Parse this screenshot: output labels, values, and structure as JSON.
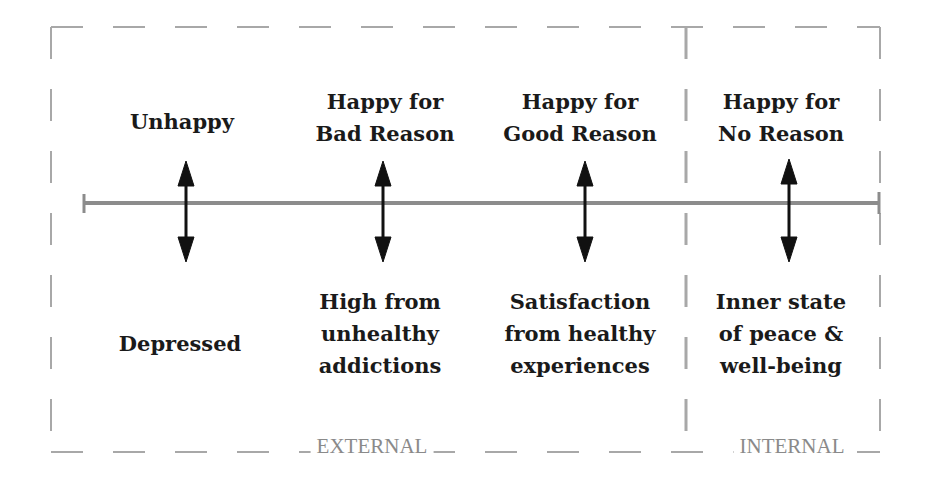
{
  "diagram": {
    "columns": [
      {
        "top": "Unhappy",
        "bottom": "Depressed",
        "x": 186
      },
      {
        "top": "Happy for\nBad Reason",
        "bottom": "High from\nunhealthy\naddictions",
        "x": 383
      },
      {
        "top": "Happy for\nGood Reason",
        "bottom": "Satisfaction\nfrom healthy\nexperiences",
        "x": 585
      },
      {
        "top": "Happy for\nNo Reason",
        "bottom": "Inner state\nof peace &\nwell-being",
        "x": 789
      }
    ],
    "regions": [
      {
        "label": "EXTERNAL"
      },
      {
        "label": "INTERNAL"
      }
    ],
    "colors": {
      "text": "#1a1a1a",
      "axis": "#8c8c8c",
      "border": "#a0a0a0",
      "arrow": "#111111",
      "region_label": "#8a8a8a"
    }
  }
}
